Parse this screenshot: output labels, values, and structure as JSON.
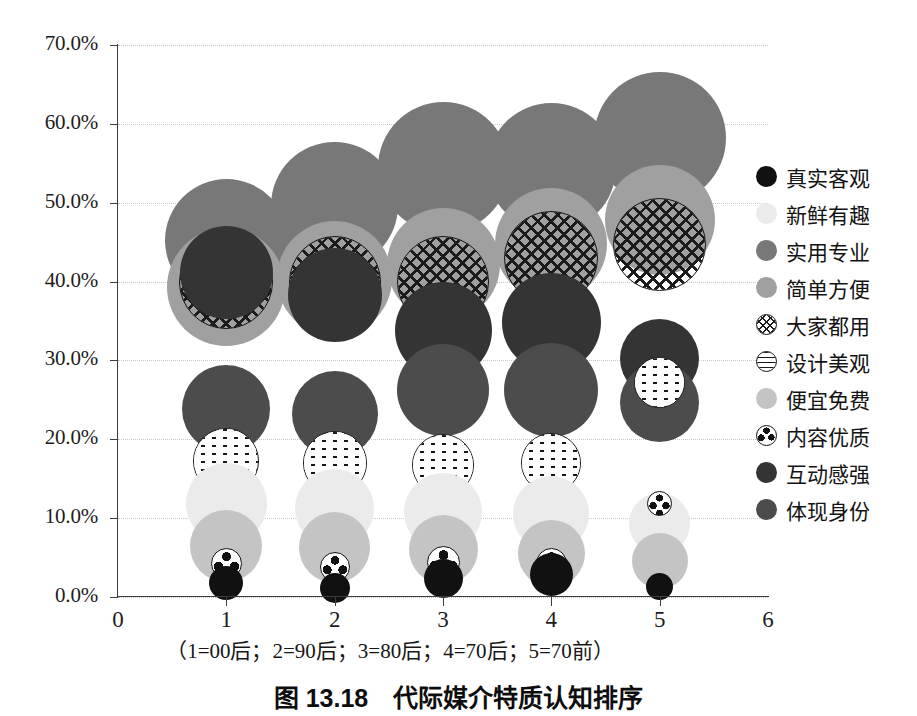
{
  "figure": {
    "title": "图 13.18　代际媒介特质认知排序",
    "x_caption": "（1=00后；2=90后；3=80后；4=70后；5=70前）"
  },
  "axes": {
    "y_ticks": [
      "0.0%",
      "10.0%",
      "20.0%",
      "30.0%",
      "40.0%",
      "50.0%",
      "60.0%",
      "70.0%"
    ],
    "x_ticks": [
      "0",
      "1",
      "2",
      "3",
      "4",
      "5",
      "6"
    ]
  },
  "legend": {
    "items": [
      {
        "label": "真实客观",
        "marker": "solid",
        "color": "#111111"
      },
      {
        "label": "新鲜有趣",
        "marker": "solid",
        "color": "#ebebeb"
      },
      {
        "label": "实用专业",
        "marker": "solid",
        "color": "#787878"
      },
      {
        "label": "简单方便",
        "marker": "solid",
        "color": "#a0a0a0"
      },
      {
        "label": "大家都用",
        "marker": "crosshatch",
        "color": "#ffffff"
      },
      {
        "label": "设计美观",
        "marker": "dashes",
        "color": "#ffffff"
      },
      {
        "label": "便宜免费",
        "marker": "solid",
        "color": "#c4c4c4"
      },
      {
        "label": "内容优质",
        "marker": "ball",
        "color": "#ffffff"
      },
      {
        "label": "互动感强",
        "marker": "solid",
        "color": "#343434"
      },
      {
        "label": "体现身份",
        "marker": "solid",
        "color": "#4c4c4c"
      }
    ]
  },
  "chart_data": {
    "type": "scatter",
    "title": "图 13.18　代际媒介特质认知排序",
    "xlabel": "（1=00后；2=90后；3=80后；4=70后；5=70前）",
    "ylabel": "",
    "xlim": [
      0,
      6
    ],
    "ylim": [
      0,
      0.7
    ],
    "grid": true,
    "legend_position": "right",
    "x": [
      1,
      2,
      3,
      4,
      5
    ],
    "x_category_labels": [
      "00后",
      "90后",
      "80后",
      "70后",
      "70前"
    ],
    "series": [
      {
        "name": "实用专业",
        "color": "#787878",
        "style": "solid",
        "values": [
          0.452,
          0.497,
          0.545,
          0.545,
          0.582
        ],
        "sizes": [
          123,
          127,
          131,
          129,
          132
        ]
      },
      {
        "name": "简单方便",
        "color": "#a0a0a0",
        "style": "solid",
        "values": [
          0.393,
          0.404,
          0.422,
          0.448,
          0.478
        ],
        "sizes": [
          118,
          115,
          113,
          112,
          110
        ]
      },
      {
        "name": "大家都用",
        "color": "#ffffff",
        "style": "crosshatch",
        "values": [
          0.4,
          0.4,
          0.4,
          0.43,
          0.447
        ],
        "sizes": [
          94,
          92,
          92,
          94,
          93
        ]
      },
      {
        "name": "互动感强",
        "color": "#343434",
        "style": "solid",
        "values": [
          0.412,
          0.383,
          0.338,
          0.348,
          0.303
        ],
        "sizes": [
          93,
          94,
          97,
          99,
          79
        ]
      },
      {
        "name": "体现身份",
        "color": "#4c4c4c",
        "style": "solid",
        "values": [
          0.238,
          0.232,
          0.262,
          0.263,
          0.247
        ],
        "sizes": [
          88,
          86,
          92,
          94,
          79
        ]
      },
      {
        "name": "设计美观",
        "color": "#ffffff",
        "style": "dashes",
        "values": [
          0.172,
          0.17,
          0.168,
          0.17,
          0.272
        ],
        "sizes": [
          66,
          64,
          62,
          60,
          51
        ]
      },
      {
        "name": "新鲜有趣",
        "color": "#ebebeb",
        "style": "solid",
        "values": [
          0.118,
          0.112,
          0.108,
          0.105,
          0.093
        ],
        "sizes": [
          81,
          79,
          78,
          76,
          61
        ]
      },
      {
        "name": "便宜免费",
        "color": "#c4c4c4",
        "style": "solid",
        "values": [
          0.065,
          0.063,
          0.06,
          0.055,
          0.046
        ],
        "sizes": [
          72,
          71,
          69,
          67,
          56
        ]
      },
      {
        "name": "内容优质",
        "color": "#ffffff",
        "style": "ball",
        "values": [
          0.042,
          0.038,
          0.044,
          0.042,
          0.118
        ],
        "sizes": [
          31,
          30,
          33,
          31,
          25
        ]
      },
      {
        "name": "真实客观",
        "color": "#111111",
        "style": "solid",
        "values": [
          0.018,
          0.012,
          0.024,
          0.029,
          0.013
        ],
        "sizes": [
          34,
          30,
          39,
          43,
          27
        ]
      }
    ]
  }
}
